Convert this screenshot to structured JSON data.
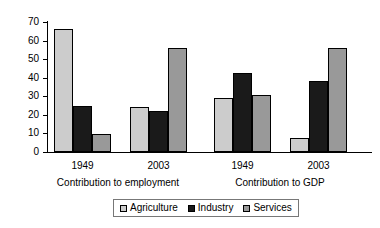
{
  "chart_data": {
    "type": "bar",
    "title": "",
    "xlabel": "",
    "ylabel": "",
    "ylim": [
      0,
      70
    ],
    "yticks": [
      0,
      10,
      20,
      30,
      40,
      50,
      60,
      70
    ],
    "grid": false,
    "legend_position": "bottom",
    "categories": [
      "1949",
      "2003",
      "1949",
      "2003"
    ],
    "group_labels": [
      "Contribution to employment",
      "Contribution to GDP"
    ],
    "series": [
      {
        "name": "Agriculture",
        "color": "#cccccc",
        "values": [
          66,
          24,
          29,
          7.5
        ]
      },
      {
        "name": "Industry",
        "color": "#1a1a1a",
        "values": [
          25,
          22,
          42.5,
          38
        ]
      },
      {
        "name": "Services",
        "color": "#999999",
        "values": [
          9.5,
          56,
          30.5,
          56
        ]
      }
    ]
  },
  "axis": {
    "y_tick_labels": [
      "70",
      "60",
      "50",
      "40",
      "30",
      "20",
      "10",
      "0"
    ]
  },
  "groups": [
    {
      "category": "1949",
      "section": "Contribution to employment"
    },
    {
      "category": "2003",
      "section": "Contribution to employment"
    },
    {
      "category": "1949",
      "section": "Contribution to GDP"
    },
    {
      "category": "2003",
      "section": "Contribution to GDP"
    }
  ],
  "sections": [
    {
      "label": "Contribution to employment"
    },
    {
      "label": "Contribution to GDP"
    }
  ],
  "legend": {
    "items": [
      {
        "label": "Agriculture",
        "color": "#cccccc",
        "icon": "legend-swatch-icon"
      },
      {
        "label": "Industry",
        "color": "#1a1a1a",
        "icon": "legend-swatch-icon"
      },
      {
        "label": "Services",
        "color": "#999999",
        "icon": "legend-swatch-icon"
      }
    ]
  }
}
